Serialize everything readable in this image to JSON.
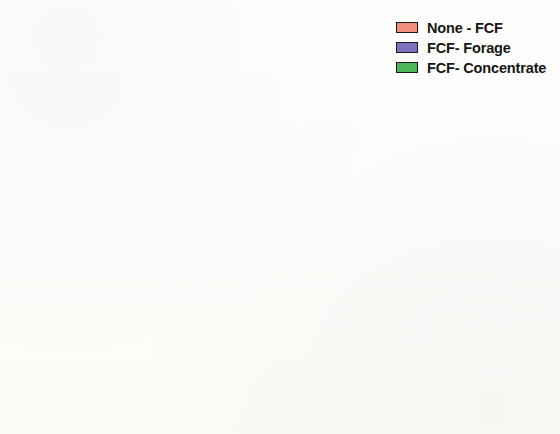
{
  "chart_data": {
    "type": "pie",
    "title": "",
    "subtitle": "",
    "xlabel": "",
    "ylabel": "",
    "categories": [
      "None - FCF",
      "FCF- Forage",
      "FCF- Concentrate"
    ],
    "values": [
      36.4,
      49.0,
      14.6
    ],
    "value_labels": [
      "36.4%",
      "49.0%",
      "14.6%"
    ],
    "colors": [
      "#f2907c",
      "#7b73c0",
      "#4eb55a"
    ],
    "units": "percent",
    "legend_position": "top-right",
    "grid": false,
    "slice_order_clockwise_from_top": [
      "FCF- Forage",
      "FCF- Concentrate",
      "None - FCF"
    ],
    "slices": [
      {
        "label": "None - FCF",
        "value": 36.4,
        "value_label": "36.4%",
        "color": "#f2907c",
        "start_angle_deg": 231.0,
        "end_angle_deg": 360.0,
        "label_x": 114,
        "label_y": 176
      },
      {
        "label": "FCF- Forage",
        "value": 49.0,
        "value_label": "49.0%",
        "color": "#7b73c0",
        "start_angle_deg": 0.0,
        "end_angle_deg": 176.4,
        "label_x": 295,
        "label_y": 205
      },
      {
        "label": "FCF- Concentrate",
        "value": 14.6,
        "value_label": "14.6%",
        "color": "#4eb55a",
        "start_angle_deg": 176.4,
        "end_angle_deg": 231.0,
        "label_x": 185,
        "label_y": 328
      }
    ]
  },
  "legend": {
    "items": [
      {
        "label": "None - FCF",
        "color": "#f2907c",
        "swatch_name": "legend-swatch-none-fcf"
      },
      {
        "label": "FCF- Forage",
        "color": "#7b73c0",
        "swatch_name": "legend-swatch-fcf-forage"
      },
      {
        "label": "FCF- Concentrate",
        "color": "#4eb55a",
        "swatch_name": "legend-swatch-fcf-concentrate"
      }
    ]
  },
  "pie_geometry": {
    "center_x": 213,
    "center_y": 222,
    "radius": 207,
    "outline_color": "#262626"
  }
}
